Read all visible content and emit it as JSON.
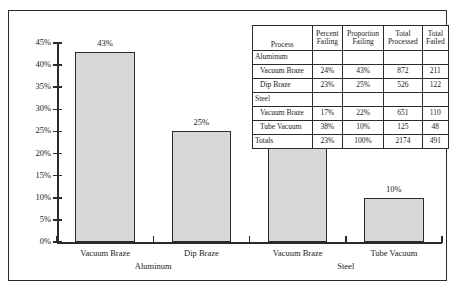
{
  "chart_data": {
    "type": "bar",
    "title": "",
    "xlabel": "",
    "ylabel": "",
    "ylim": [
      0,
      45
    ],
    "grid": false,
    "legend": "none",
    "categories": [
      "Vacuum Braze",
      "Dip Braze",
      "Vacuum Braze",
      "Tube Vacuum"
    ],
    "groups": [
      "Aluminum",
      "Aluminum",
      "Steel",
      "Steel"
    ],
    "group_labels": [
      "Aluminum",
      "Steel"
    ],
    "values": [
      43,
      25,
      22,
      10
    ],
    "value_labels": [
      "43%",
      "25%",
      "22%",
      "10%"
    ],
    "ytick_labels": [
      "0%",
      "5%",
      "10%",
      "15%",
      "20%",
      "25%",
      "30%",
      "35%",
      "40%",
      "45%"
    ],
    "ytick_values": [
      0,
      5,
      10,
      15,
      20,
      25,
      30,
      35,
      40,
      45
    ],
    "bar_fill": "#d8d8d8",
    "bar_stroke": "#2b2b2b"
  },
  "table": {
    "headers": {
      "process": "Process",
      "percent_failing_l1": "Percent",
      "percent_failing_l2": "Failing",
      "proportion_failing_l1": "Proportion",
      "proportion_failing_l2": "Failing",
      "total_processed_l1": "Total",
      "total_processed_l2": "Processed",
      "total_failed_l1": "Total",
      "total_failed_l2": "Failed"
    },
    "rows": [
      {
        "kind": "group",
        "process": "Aluminum",
        "percent": "",
        "proportion": "",
        "processed": "",
        "failed": ""
      },
      {
        "kind": "item",
        "process": "Vacuum Braze",
        "percent": "24%",
        "proportion": "43%",
        "processed": "872",
        "failed": "211"
      },
      {
        "kind": "item",
        "process": "Dip Braze",
        "percent": "23%",
        "proportion": "25%",
        "processed": "526",
        "failed": "122"
      },
      {
        "kind": "group",
        "process": "Steel",
        "percent": "",
        "proportion": "",
        "processed": "",
        "failed": ""
      },
      {
        "kind": "item",
        "process": "Vacuum Braze",
        "percent": "17%",
        "proportion": "22%",
        "processed": "651",
        "failed": "110"
      },
      {
        "kind": "item",
        "process": "Tube Vacuum",
        "percent": "38%",
        "proportion": "10%",
        "processed": "125",
        "failed": "48"
      },
      {
        "kind": "totals",
        "process": "Totals",
        "percent": "23%",
        "proportion": "100%",
        "processed": "2174",
        "failed": "491"
      }
    ]
  }
}
